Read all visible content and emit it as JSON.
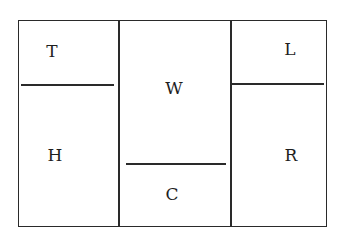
{
  "diagram": {
    "labels": {
      "T": "T",
      "H": "H",
      "W": "W",
      "C": "C",
      "L": "L",
      "R": "R"
    },
    "line_color": "#2a2a2a"
  }
}
